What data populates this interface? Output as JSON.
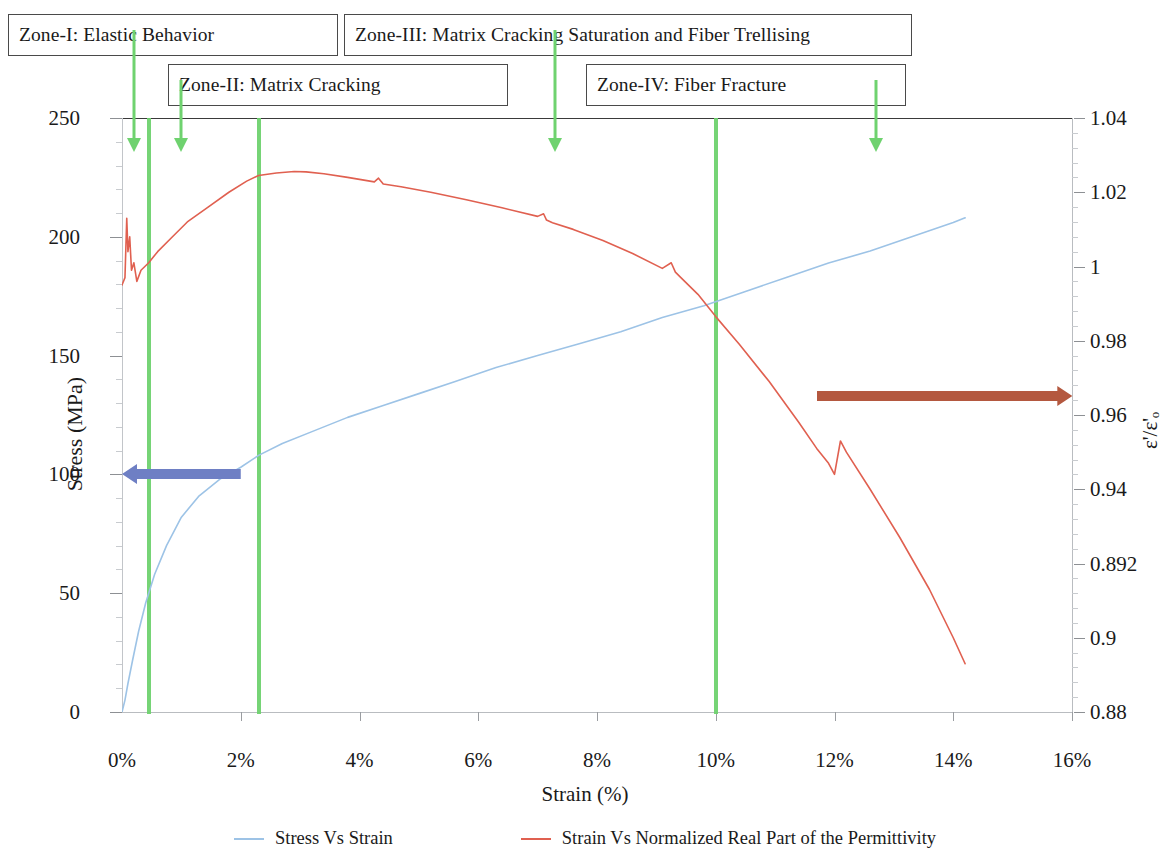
{
  "annotations": {
    "zones": [
      {
        "id": "zone1",
        "label": "Zone-I: Elastic Behavior"
      },
      {
        "id": "zone2",
        "label": "Zone-II: Matrix Cracking"
      },
      {
        "id": "zone3",
        "label": "Zone-III: Matrix Cracking Saturation and Fiber Trellising"
      },
      {
        "id": "zone4",
        "label": "Zone-IV: Fiber Fracture"
      }
    ],
    "pointer_color": "#6fd26f",
    "zone_boundaries_strain_pct": [
      0.45,
      2.3,
      10.0
    ],
    "pointer_arrows_strain_pct": [
      0.2,
      1.0,
      7.3,
      12.7
    ],
    "stress_range_arrow": {
      "color": "#6e7fc4",
      "direction": "left",
      "y_value_mpa": 100,
      "x_from_pct": 2.0,
      "x_to_pct": 0.0
    },
    "permittivity_range_arrow": {
      "color": "#b4583f",
      "direction": "right",
      "y_value_ratio": 0.965,
      "x_from_pct": 11.7,
      "x_to_pct": 16.0
    }
  },
  "chart_data": {
    "type": "line",
    "title": "",
    "xlabel": "Strain (%)",
    "ylabel": "Stress (MPa)",
    "ylabel_secondary": "ε'/ε'ₒ",
    "grid": false,
    "legend_position": "bottom",
    "xlim": [
      0,
      16
    ],
    "xticks": [
      "0%",
      "2%",
      "4%",
      "6%",
      "8%",
      "10%",
      "12%",
      "14%",
      "16%"
    ],
    "xtick_values": [
      0,
      2,
      4,
      6,
      8,
      10,
      12,
      14,
      16
    ],
    "ylim": [
      0,
      250
    ],
    "yticks": [
      "0",
      "50",
      "100",
      "150",
      "200",
      "250"
    ],
    "ytick_values": [
      0,
      50,
      100,
      150,
      200,
      250
    ],
    "ylim_secondary": [
      0.88,
      1.04
    ],
    "yticks_secondary": [
      "0.88",
      "0.9",
      "0.892",
      "0.94",
      "0.96",
      "0.98",
      "1",
      "1.02",
      "1.04"
    ],
    "ytick_values_secondary": [
      0.88,
      0.9,
      0.92,
      0.94,
      0.96,
      0.98,
      1.0,
      1.02,
      1.04
    ],
    "series": [
      {
        "name": "Stress Vs Strain",
        "color": "#9dc3e6",
        "axis": "left",
        "x": [
          0.0,
          0.05,
          0.1,
          0.18,
          0.28,
          0.4,
          0.55,
          0.75,
          1.0,
          1.3,
          1.65,
          2.0,
          2.3,
          2.7,
          3.2,
          3.8,
          4.4,
          5.0,
          5.6,
          6.3,
          7.0,
          7.7,
          8.4,
          9.1,
          9.8,
          10.5,
          11.2,
          11.9,
          12.6,
          13.3,
          14.0,
          14.2
        ],
        "y": [
          0,
          5,
          12,
          22,
          34,
          46,
          58,
          70,
          82,
          91,
          98,
          103,
          108,
          113,
          118,
          124,
          129,
          134,
          139,
          145,
          150,
          155,
          160,
          166,
          171,
          177,
          183,
          189,
          194,
          200,
          206,
          208
        ]
      },
      {
        "name": "Strain Vs Normalized Real Part of the Permittivity",
        "color": "#e06050",
        "axis": "right",
        "x": [
          0.0,
          0.05,
          0.08,
          0.1,
          0.13,
          0.16,
          0.2,
          0.25,
          0.32,
          0.45,
          0.6,
          0.85,
          1.1,
          1.45,
          1.8,
          2.1,
          2.3,
          2.6,
          2.9,
          3.1,
          3.4,
          3.8,
          4.1,
          4.25,
          4.32,
          4.4,
          4.7,
          5.2,
          5.8,
          6.4,
          7.0,
          7.1,
          7.15,
          7.25,
          7.6,
          8.1,
          8.6,
          9.1,
          9.25,
          9.32,
          9.4,
          9.7,
          10.0,
          10.4,
          10.9,
          11.4,
          11.7,
          11.9,
          12.0,
          12.1,
          12.2,
          12.6,
          13.1,
          13.6,
          14.0,
          14.2
        ],
        "y": [
          0.995,
          0.997,
          1.013,
          1.004,
          1.008,
          0.999,
          1.001,
          0.996,
          0.999,
          1.001,
          1.004,
          1.008,
          1.012,
          1.016,
          1.02,
          1.023,
          1.0245,
          1.0252,
          1.0256,
          1.0255,
          1.025,
          1.024,
          1.0232,
          1.0228,
          1.0238,
          1.0222,
          1.0215,
          1.02,
          1.018,
          1.0158,
          1.0135,
          1.0142,
          1.0125,
          1.0118,
          1.01,
          1.007,
          1.0035,
          0.9995,
          1.001,
          0.9985,
          0.9972,
          0.9925,
          0.9865,
          0.979,
          0.969,
          0.958,
          0.951,
          0.947,
          0.944,
          0.953,
          0.95,
          0.94,
          0.927,
          0.913,
          0.9,
          0.893
        ]
      }
    ],
    "noise_spikes": [
      {
        "series": "permittivity",
        "strain_pct": 0.08,
        "description": "initial noise burst"
      },
      {
        "series": "permittivity",
        "strain_pct": 4.3,
        "description": "small upward spike"
      },
      {
        "series": "permittivity",
        "strain_pct": 7.1,
        "description": "small upward spike"
      },
      {
        "series": "permittivity",
        "strain_pct": 9.3,
        "description": "small upward spike"
      },
      {
        "series": "permittivity",
        "strain_pct": 12.1,
        "description": "upward jump before final drop"
      }
    ]
  }
}
